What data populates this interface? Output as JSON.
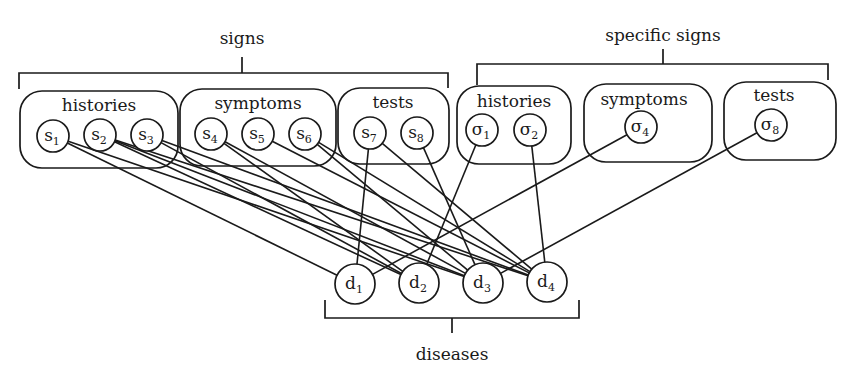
{
  "brackets": [
    {
      "id": "signs",
      "label": "signs",
      "x1": 19,
      "x2": 448,
      "y": 73,
      "tickX": 242,
      "tickTop": 57,
      "labelX": 242,
      "labelY": 44,
      "leftDrop": 89,
      "rightDrop": 88
    },
    {
      "id": "specific-signs",
      "label": "specific signs",
      "x1": 477,
      "x2": 828,
      "y": 64,
      "tickX": 663,
      "tickTop": 49,
      "labelX": 663,
      "labelY": 41,
      "leftDrop": 85,
      "rightDrop": 80
    },
    {
      "id": "diseases",
      "label": "diseases",
      "x1": 325,
      "x2": 579,
      "y": 318,
      "tickX": 452,
      "tickBottom": 333,
      "labelX": 452,
      "labelY": 360,
      "leftDrop": 300,
      "rightDrop": 300,
      "inverted": true
    }
  ],
  "groups": [
    {
      "id": "histories",
      "label": "histories",
      "x": 20,
      "y": 91,
      "w": 158,
      "h": 77,
      "labelX": 99,
      "labelY": 111
    },
    {
      "id": "symptoms",
      "label": "symptoms",
      "x": 180,
      "y": 89,
      "w": 156,
      "h": 77,
      "labelX": 258,
      "labelY": 109
    },
    {
      "id": "tests",
      "label": "tests",
      "x": 338,
      "y": 88,
      "w": 111,
      "h": 76,
      "labelX": 393,
      "labelY": 108
    },
    {
      "id": "specific-histories",
      "label": "histories",
      "x": 457,
      "y": 86,
      "w": 114,
      "h": 78,
      "labelX": 514,
      "labelY": 107
    },
    {
      "id": "specific-symptoms",
      "label": "symptoms",
      "x": 584,
      "y": 84,
      "w": 128,
      "h": 78,
      "labelX": 644,
      "labelY": 105
    },
    {
      "id": "specific-tests",
      "label": "tests",
      "x": 724,
      "y": 82,
      "w": 112,
      "h": 78,
      "labelX": 774,
      "labelY": 101
    }
  ],
  "nodes": [
    {
      "id": "s1",
      "base": "s",
      "sub": "1",
      "x": 53,
      "y": 136,
      "r": 16
    },
    {
      "id": "s2",
      "base": "s",
      "sub": "2",
      "x": 100,
      "y": 135,
      "r": 16
    },
    {
      "id": "s3",
      "base": "s",
      "sub": "3",
      "x": 147,
      "y": 135,
      "r": 16
    },
    {
      "id": "s4",
      "base": "s",
      "sub": "4",
      "x": 211,
      "y": 134,
      "r": 16
    },
    {
      "id": "s5",
      "base": "s",
      "sub": "5",
      "x": 258,
      "y": 134,
      "r": 16
    },
    {
      "id": "s6",
      "base": "s",
      "sub": "6",
      "x": 305,
      "y": 134,
      "r": 16
    },
    {
      "id": "s7",
      "base": "s",
      "sub": "7",
      "x": 370,
      "y": 133,
      "r": 16
    },
    {
      "id": "s8",
      "base": "s",
      "sub": "8",
      "x": 417,
      "y": 133,
      "r": 16
    },
    {
      "id": "sigma1",
      "base": "σ",
      "sub": "1",
      "x": 482,
      "y": 130,
      "r": 16
    },
    {
      "id": "sigma2",
      "base": "σ",
      "sub": "2",
      "x": 530,
      "y": 130,
      "r": 16
    },
    {
      "id": "sigma4",
      "base": "σ",
      "sub": "4",
      "x": 641,
      "y": 127,
      "r": 16
    },
    {
      "id": "sigma8",
      "base": "σ",
      "sub": "8",
      "x": 771,
      "y": 125,
      "r": 16
    },
    {
      "id": "d1",
      "base": "d",
      "sub": "1",
      "x": 355,
      "y": 284,
      "r": 20
    },
    {
      "id": "d2",
      "base": "d",
      "sub": "2",
      "x": 419,
      "y": 283,
      "r": 20
    },
    {
      "id": "d3",
      "base": "d",
      "sub": "3",
      "x": 483,
      "y": 283,
      "r": 20
    },
    {
      "id": "d4",
      "base": "d",
      "sub": "4",
      "x": 547,
      "y": 282,
      "r": 20
    }
  ],
  "edges": [
    [
      "s1",
      "d1"
    ],
    [
      "s1",
      "d3"
    ],
    [
      "s2",
      "d2"
    ],
    [
      "s2",
      "d3"
    ],
    [
      "s2",
      "d4"
    ],
    [
      "s3",
      "d2"
    ],
    [
      "s3",
      "d4"
    ],
    [
      "s4",
      "d2"
    ],
    [
      "s4",
      "d3"
    ],
    [
      "s5",
      "d4"
    ],
    [
      "s6",
      "d3"
    ],
    [
      "s6",
      "d4"
    ],
    [
      "s7",
      "d1"
    ],
    [
      "s7",
      "d4"
    ],
    [
      "s8",
      "d3"
    ],
    [
      "sigma1",
      "d2"
    ],
    [
      "sigma2",
      "d4"
    ],
    [
      "sigma4",
      "d1"
    ],
    [
      "sigma8",
      "d3"
    ]
  ]
}
